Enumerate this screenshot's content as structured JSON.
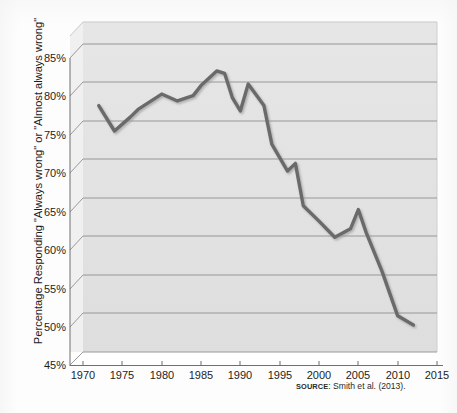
{
  "figure": {
    "background_color": "#fdfdfd",
    "plot_fill_color": "#e3e3e3",
    "plot_riser_color": "#efefef",
    "gridline_color": "#8c8c8c",
    "axis_color": "#6f6f6f",
    "line_color": "#6b6b6b",
    "text_color": "#1d1d1d"
  },
  "y_axis": {
    "title": "Percentage Responding \"Always wrong\" or \"Almost always wrong\"",
    "ticks": [
      "45%",
      "50%",
      "55%",
      "60%",
      "65%",
      "70%",
      "75%",
      "80%",
      "85%"
    ]
  },
  "x_axis": {
    "ticks": [
      "1970",
      "1975",
      "1980",
      "1985",
      "1990",
      "1995",
      "2000",
      "2005",
      "2010",
      "2015"
    ]
  },
  "source": {
    "label": "SOURCE",
    "text": ": Smith et al. (2013)."
  },
  "chart_data": {
    "type": "line",
    "title": "",
    "subtitle": "",
    "xlabel": "",
    "ylabel": "Percentage Responding \"Always wrong\" or \"Almost always wrong\"",
    "xlim": [
      1970,
      2015
    ],
    "ylim": [
      45,
      85
    ],
    "xticks": [
      1970,
      1975,
      1980,
      1985,
      1990,
      1995,
      2000,
      2005,
      2010,
      2015
    ],
    "yticks": [
      45,
      50,
      55,
      60,
      65,
      70,
      75,
      80,
      85
    ],
    "ytick_format": "percent",
    "grid": "horizontal",
    "legend": "none",
    "style_3d": true,
    "series": [
      {
        "name": "Percentage responding \"Always wrong\" or \"Almost always wrong\"",
        "color": "#6b6b6b",
        "x": [
          1972,
          1974,
          1976,
          1977,
          1980,
          1982,
          1984,
          1985,
          1987,
          1988,
          1989,
          1990,
          1991,
          1993,
          1994,
          1996,
          1997,
          1998,
          2000,
          2002,
          2004,
          2005,
          2006,
          2008,
          2010,
          2012
        ],
        "values": [
          77.0,
          73.7,
          75.5,
          76.5,
          78.5,
          77.6,
          78.3,
          79.6,
          81.5,
          81.2,
          78.0,
          76.3,
          79.8,
          77.0,
          72.0,
          68.5,
          69.5,
          64.0,
          62.0,
          59.9,
          61.0,
          63.5,
          60.5,
          55.5,
          49.7,
          48.5
        ]
      }
    ]
  }
}
